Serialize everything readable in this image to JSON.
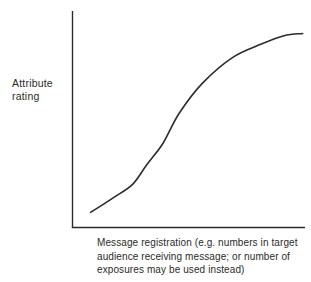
{
  "figure": {
    "y_axis_label_lines": [
      "Attribute",
      "rating"
    ],
    "caption_lines": [
      "Message registration (e.g. numbers in target",
      "audience receiving message; or number of",
      "exposures may be used instead)"
    ]
  },
  "colors": {
    "ink": "#2b2b2b",
    "background": "#ffffff"
  },
  "chart_data": {
    "type": "line",
    "title": "",
    "ylabel": "Attribute rating",
    "xlabel": "Message registration (e.g. numbers in target audience receiving message; or number of exposures may be used instead)",
    "x": [
      0.08,
      0.18,
      0.26,
      0.32,
      0.39,
      0.46,
      0.56,
      0.69,
      0.81,
      0.91,
      0.99
    ],
    "y": [
      0.07,
      0.14,
      0.2,
      0.29,
      0.39,
      0.53,
      0.67,
      0.79,
      0.85,
      0.89,
      0.9
    ],
    "xlim": [
      0,
      1
    ],
    "ylim": [
      0,
      1
    ],
    "ticks": "none",
    "grid": false,
    "legend": "none",
    "shape_note": "S-shaped (sigmoid) advertising response curve rising slowly, steep middle, plateau at top right"
  }
}
